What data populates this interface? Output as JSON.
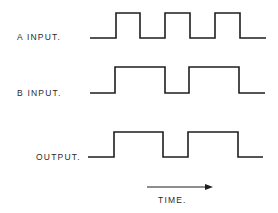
{
  "diagram": {
    "type": "timing-diagram",
    "signals": [
      {
        "label": "A INPUT.",
        "label_x": 17,
        "label_y": 40,
        "low_y": 38,
        "high_y": 13,
        "start_x": 90,
        "end_x": 266,
        "transitions": [
          116,
          140,
          165,
          190,
          215,
          240
        ],
        "initial_level": "low"
      },
      {
        "label": "B INPUT.",
        "label_x": 17,
        "label_y": 96,
        "low_y": 93,
        "high_y": 67,
        "start_x": 90,
        "end_x": 265,
        "transitions": [
          115,
          165,
          189,
          239
        ],
        "initial_level": "low"
      },
      {
        "label": "OUTPUT.",
        "label_x": 36,
        "label_y": 160,
        "low_y": 157,
        "high_y": 132,
        "start_x": 88,
        "end_x": 263,
        "transitions": [
          114,
          163,
          188,
          238
        ],
        "initial_level": "low"
      }
    ],
    "time_axis": {
      "label": "TIME.",
      "arrow_start_x": 147,
      "arrow_end_x": 213,
      "arrow_y": 187,
      "label_x": 158,
      "label_y": 203
    },
    "colors": {
      "stroke": "#1e1e1e",
      "text": "#2a2a2a",
      "background": "#ffffff"
    }
  }
}
